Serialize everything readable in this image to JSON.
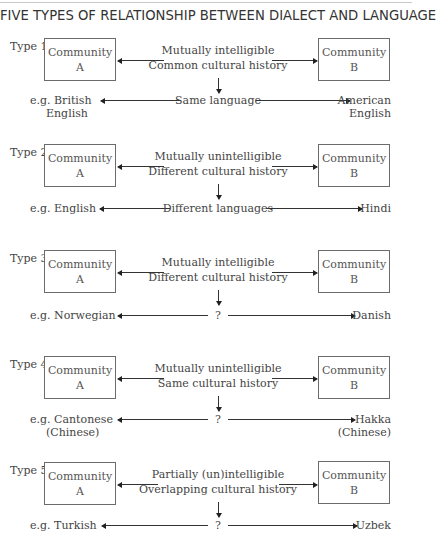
{
  "title": "FIVE TYPES OF RELATIONSHIP BETWEEN DIALECT AND LANGUAGE",
  "types": [
    {
      "label": "Type 1",
      "box_a": {
        "line1": "Community",
        "line2": "A"
      },
      "box_b": {
        "line1": "Community",
        "line2": "B"
      },
      "relation": {
        "line1": "Mutually intelligible",
        "line2": "Common cultural history"
      },
      "outcome": "Same language",
      "example_left": {
        "line1": "e.g. British",
        "line2": "English"
      },
      "example_right": {
        "line1": "American",
        "line2": "English"
      }
    },
    {
      "label": "Type 2",
      "box_a": {
        "line1": "Community",
        "line2": "A"
      },
      "box_b": {
        "line1": "Community",
        "line2": "B"
      },
      "relation": {
        "line1": "Mutually unintelligible",
        "line2": "Different cultural history"
      },
      "outcome": "Different languages",
      "example_left": {
        "line1": "e.g. English",
        "line2": ""
      },
      "example_right": {
        "line1": "Hindi",
        "line2": ""
      }
    },
    {
      "label": "Type 3",
      "box_a": {
        "line1": "Community",
        "line2": "A"
      },
      "box_b": {
        "line1": "Community",
        "line2": "B"
      },
      "relation": {
        "line1": "Mutually intelligible",
        "line2": "Different cultural history"
      },
      "outcome": "?",
      "example_left": {
        "line1": "e.g. Norwegian",
        "line2": ""
      },
      "example_right": {
        "line1": "Danish",
        "line2": ""
      }
    },
    {
      "label": "Type 4",
      "box_a": {
        "line1": "Community",
        "line2": "A"
      },
      "box_b": {
        "line1": "Community",
        "line2": "B"
      },
      "relation": {
        "line1": "Mutually unintelligible",
        "line2": "Same cultural history"
      },
      "outcome": "?",
      "example_left": {
        "line1": "e.g. Cantonese",
        "line2": "(Chinese)"
      },
      "example_right": {
        "line1": "Hakka",
        "line2": "(Chinese)"
      }
    },
    {
      "label": "Type 5",
      "box_a": {
        "line1": "Community",
        "line2": "A"
      },
      "box_b": {
        "line1": "Community",
        "line2": "B"
      },
      "relation": {
        "line1": "Partially (un)intelligible",
        "line2": "Overlapping cultural history"
      },
      "outcome": "?",
      "example_left": {
        "line1": "e.g. Turkish",
        "line2": ""
      },
      "example_right": {
        "line1": "Uzbek",
        "line2": ""
      }
    }
  ]
}
